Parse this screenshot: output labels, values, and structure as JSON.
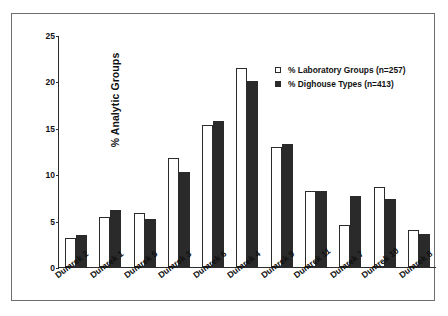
{
  "chart_data": {
    "type": "bar",
    "title": "",
    "xlabel": "",
    "ylabel": "% Analytic Groups",
    "ylim": [
      0,
      25
    ],
    "yticks": [
      0,
      5,
      10,
      15,
      20,
      25
    ],
    "grid": false,
    "legend_position": "top-right",
    "categories": [
      "Dumrek 2",
      "Dumrek 1",
      "Dumrek 5",
      "Dumrek 3",
      "Dumrek 6",
      "Dumrek 4",
      "Dumrek 9",
      "Dumrek 11",
      "Dumrek 7",
      "Dumrek 10",
      "Dumrek 8"
    ],
    "series": [
      {
        "name": "% Laboratory Groups (n=257)",
        "color": "#ffffff",
        "values": [
          3.1,
          5.4,
          5.8,
          11.8,
          15.3,
          21.4,
          12.9,
          8.2,
          4.5,
          8.6,
          4.0
        ]
      },
      {
        "name": "% Dighouse Types (n=413)",
        "color": "#2a2a2a",
        "values": [
          3.4,
          6.1,
          5.2,
          10.2,
          15.7,
          20.0,
          13.3,
          8.2,
          7.7,
          7.3,
          3.6
        ]
      }
    ]
  },
  "legend": {
    "items": [
      {
        "label": "% Laboratory Groups (n=257)",
        "swatch": "open-square"
      },
      {
        "label": "% Dighouse Types (n=413)",
        "swatch": "filled-square"
      }
    ]
  }
}
